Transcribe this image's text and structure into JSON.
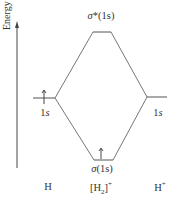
{
  "axis": {
    "label": "Energy"
  },
  "levels": {
    "antibonding": {
      "label_sym": "σ",
      "label_rest": "*(1s)"
    },
    "bonding": {
      "label_sym": "σ",
      "label_rest": "(1s)",
      "electrons": 1
    },
    "left_atomic": {
      "label_num": "1",
      "label_orb": "s",
      "electrons": 1
    },
    "right_atomic": {
      "label_num": "1",
      "label_orb": "s",
      "electrons": 0
    }
  },
  "species": {
    "left": "H",
    "center_main": "[H",
    "center_sub": "2",
    "center_close": "]",
    "center_sup": "+",
    "right_main": "H",
    "right_sup": "+"
  },
  "colors": {
    "line": "#555555",
    "text": "#333333"
  }
}
